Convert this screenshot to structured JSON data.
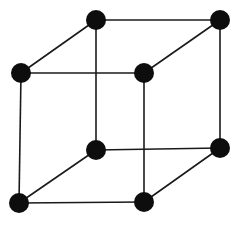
{
  "diagram": {
    "type": "cube-graph",
    "vertex_color": "#0d0d0d",
    "edge_color": "#1a1a1a",
    "background": "#ffffff",
    "vertices": [
      {
        "id": "top-back-left",
        "x": 96,
        "y": 20,
        "label": ""
      },
      {
        "id": "top-back-right",
        "x": 220,
        "y": 20,
        "label": ""
      },
      {
        "id": "top-front-left",
        "x": 21,
        "y": 73,
        "label": ""
      },
      {
        "id": "top-front-right",
        "x": 144,
        "y": 73,
        "label": ""
      },
      {
        "id": "bottom-back-left",
        "x": 96,
        "y": 150,
        "label": ""
      },
      {
        "id": "bottom-back-right",
        "x": 220,
        "y": 148,
        "label": ""
      },
      {
        "id": "bottom-front-left",
        "x": 19,
        "y": 203,
        "label": ""
      },
      {
        "id": "bottom-front-right",
        "x": 144,
        "y": 202,
        "label": ""
      }
    ],
    "edges": [
      [
        "top-back-left",
        "top-back-right"
      ],
      [
        "top-front-left",
        "top-front-right"
      ],
      [
        "top-back-left",
        "top-front-left"
      ],
      [
        "top-back-right",
        "top-front-right"
      ],
      [
        "bottom-back-left",
        "bottom-back-right"
      ],
      [
        "bottom-front-left",
        "bottom-front-right"
      ],
      [
        "bottom-back-left",
        "bottom-front-left"
      ],
      [
        "bottom-back-right",
        "bottom-front-right"
      ],
      [
        "top-back-left",
        "bottom-back-left"
      ],
      [
        "top-back-right",
        "bottom-back-right"
      ],
      [
        "top-front-left",
        "bottom-front-left"
      ],
      [
        "top-front-right",
        "bottom-front-right"
      ]
    ],
    "vertex_radius": 10
  }
}
